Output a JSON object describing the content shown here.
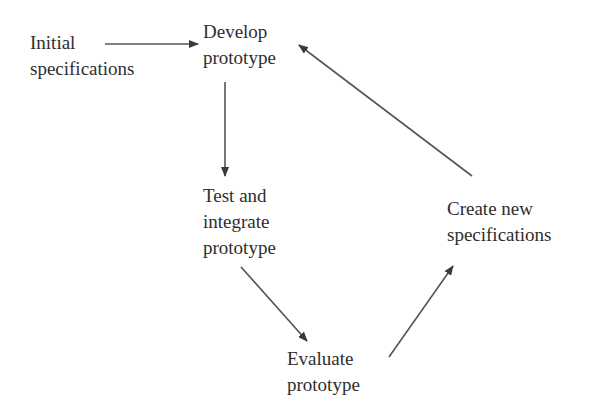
{
  "diagram": {
    "type": "flowchart",
    "nodes": [
      {
        "id": "initial",
        "lines": [
          "Initial",
          "specifications"
        ]
      },
      {
        "id": "develop",
        "lines": [
          "Develop",
          "prototype"
        ]
      },
      {
        "id": "test",
        "lines": [
          "Test and",
          "integrate",
          "prototype"
        ]
      },
      {
        "id": "evaluate",
        "lines": [
          "Evaluate",
          "prototype"
        ]
      },
      {
        "id": "create",
        "lines": [
          "Create new",
          "specifications"
        ]
      }
    ],
    "edges": [
      {
        "from": "initial",
        "to": "develop"
      },
      {
        "from": "develop",
        "to": "test"
      },
      {
        "from": "test",
        "to": "evaluate"
      },
      {
        "from": "evaluate",
        "to": "create"
      },
      {
        "from": "create",
        "to": "develop"
      }
    ],
    "colors": {
      "text": "#2e2e2e",
      "arrow": "#555555",
      "arrowhead": "#3a3a3a",
      "background": "#ffffff"
    }
  }
}
